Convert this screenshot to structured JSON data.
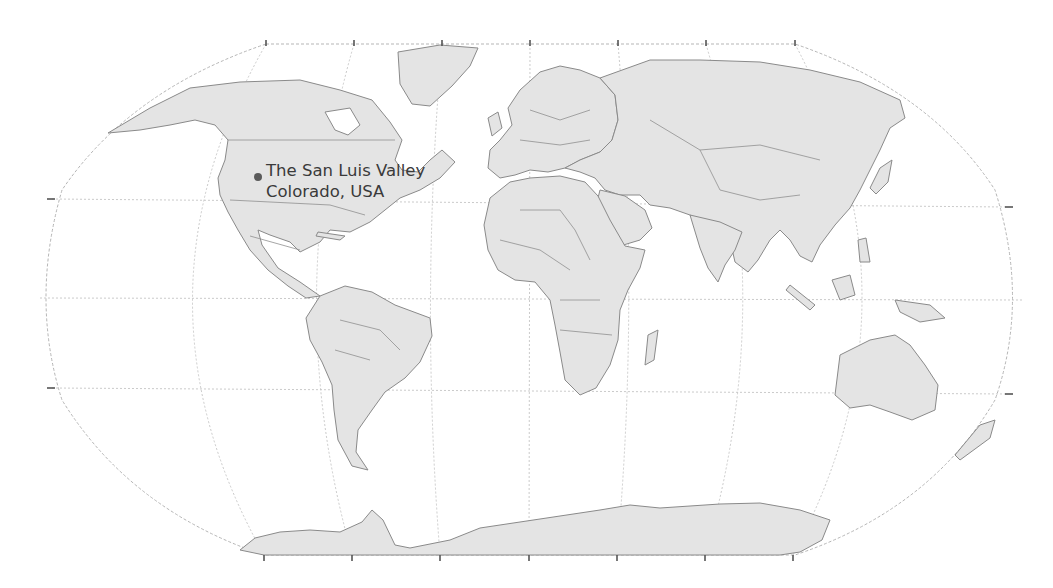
{
  "map": {
    "projection": "Robinson (world)",
    "colors": {
      "land": "#e4e4e4",
      "border": "#8a8a8a",
      "graticule": "#bdbdbd",
      "marker": "#5a5a5a",
      "label_text": "#3a3a3a",
      "background": "#ffffff"
    },
    "marker": {
      "name": "The San Luis Valley",
      "label_line1": "The San Luis Valley",
      "label_line2": "Colorado, USA"
    },
    "ticks": {
      "top_x": [
        266,
        354,
        442,
        530,
        618,
        706,
        795
      ],
      "bottom_x": [
        264,
        352,
        440,
        529,
        617,
        705,
        793
      ],
      "left_y": [
        199,
        388
      ],
      "right_y": [
        207,
        394
      ]
    }
  }
}
